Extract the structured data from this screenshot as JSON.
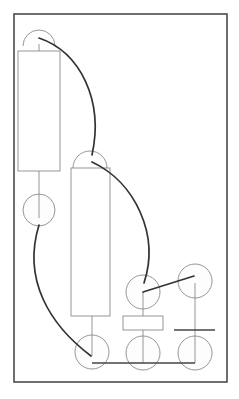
{
  "diagram": {
    "type": "schematic",
    "colors": {
      "background": "#ffffff",
      "frame": "#4a4a4a",
      "outline": "#8a8a8a",
      "wire": "#333333"
    },
    "frame": {
      "x": 14,
      "y": 14,
      "width": 213,
      "height": 368
    },
    "semicircles": [
      {
        "id": "top-left-terminal",
        "cx": 39,
        "cy": 46,
        "r": 16
      },
      {
        "id": "middle-terminal",
        "cx": 90,
        "cy": 168,
        "r": 17
      }
    ],
    "rectangles": [
      {
        "id": "tall-block-left",
        "x": 18,
        "y": 51,
        "width": 42,
        "height": 120
      },
      {
        "id": "tall-block-middle",
        "x": 71,
        "y": 168,
        "width": 39,
        "height": 148
      },
      {
        "id": "small-block",
        "x": 123,
        "y": 316,
        "width": 40,
        "height": 14
      }
    ],
    "circles": [
      {
        "id": "left-node",
        "cx": 39,
        "cy": 210,
        "r": 16
      },
      {
        "id": "upper-mid-node",
        "cx": 143,
        "cy": 292,
        "r": 17
      },
      {
        "id": "upper-right-node",
        "cx": 195,
        "cy": 281,
        "r": 17
      },
      {
        "id": "bottom-node-1",
        "cx": 92,
        "cy": 352,
        "r": 17
      },
      {
        "id": "bottom-node-2",
        "cx": 143,
        "cy": 353,
        "r": 17
      },
      {
        "id": "bottom-node-3",
        "cx": 195,
        "cy": 353,
        "r": 17
      }
    ],
    "thin_lines": [
      {
        "id": "left-stem",
        "x1": 39,
        "y1": 171,
        "x2": 39,
        "y2": 218
      },
      {
        "id": "top-left-stem",
        "x1": 39,
        "y1": 44,
        "x2": 39,
        "y2": 51
      },
      {
        "id": "middle-stem",
        "x1": 92,
        "y1": 316,
        "x2": 92,
        "y2": 356
      },
      {
        "id": "mid-node-stem-upper",
        "x1": 143,
        "y1": 292,
        "x2": 143,
        "y2": 316
      },
      {
        "id": "mid-node-stem-lower",
        "x1": 143,
        "y1": 330,
        "x2": 143,
        "y2": 363
      },
      {
        "id": "right-vertical",
        "x1": 195,
        "y1": 283,
        "x2": 195,
        "y2": 363
      }
    ],
    "wires": [
      {
        "id": "arc-1",
        "d": "M 39 38 C 80 52, 104 100, 92 155"
      },
      {
        "id": "arc-2",
        "d": "M 92 162 C 135 182, 160 235, 144 283"
      },
      {
        "id": "arc-3",
        "d": "M 39 225 C 22 280, 50 325, 91 356"
      },
      {
        "id": "diagonal-link",
        "d": "M 143 292 L 194 276"
      },
      {
        "id": "bottom-bus",
        "d": "M 92 363 L 195 363"
      },
      {
        "id": "right-bar",
        "d": "M 174 330 L 215 330"
      }
    ]
  }
}
